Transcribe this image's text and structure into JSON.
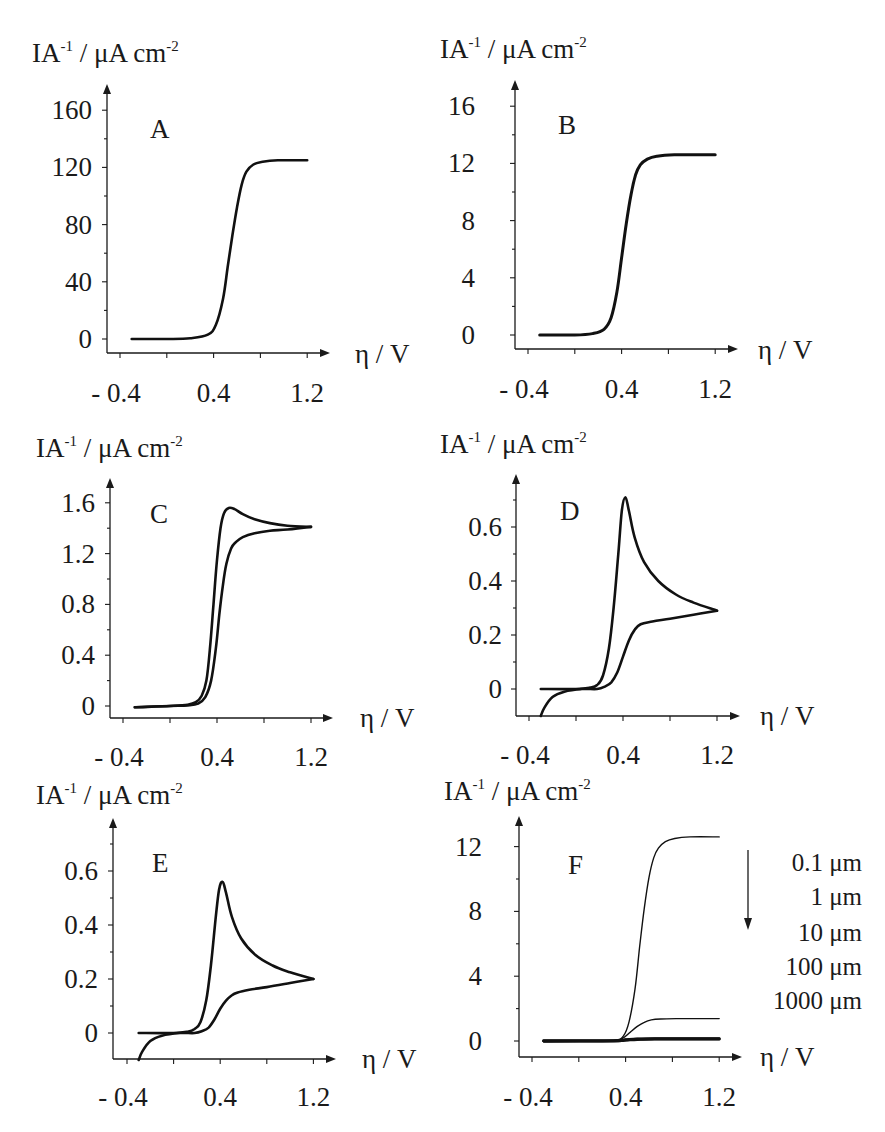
{
  "figure": {
    "ylabel_main": "IA",
    "ylabel_sup1": "-1",
    "ylabel_unit": " / μA cm",
    "ylabel_sup2": "-2",
    "xlabel": "η / V"
  },
  "chart_data": [
    {
      "panel": "A",
      "type": "line",
      "title": "A",
      "xlabel": "η / V",
      "ylabel": "IA-1 / μA cm-2",
      "xticks": [
        -0.4,
        0.0,
        0.4,
        0.8,
        1.2
      ],
      "xtick_labels": [
        "- 0.4",
        "",
        "0.4",
        "",
        "1.2"
      ],
      "yticks": [
        0,
        40,
        80,
        120,
        160
      ],
      "ytick_labels": [
        "0",
        "40",
        "80",
        "120",
        "160"
      ],
      "xlim": [
        -0.5,
        1.5
      ],
      "ylim": [
        -8,
        175
      ],
      "series": [
        {
          "name": "forward/reverse",
          "x": [
            -0.3,
            0.0,
            0.2,
            0.35,
            0.42,
            0.48,
            0.52,
            0.56,
            0.6,
            0.64,
            0.68,
            0.74,
            0.82,
            0.95,
            1.2
          ],
          "y": [
            0,
            0,
            0.5,
            3,
            10,
            28,
            50,
            72,
            92,
            108,
            117,
            122,
            124,
            125,
            125
          ]
        }
      ]
    },
    {
      "panel": "B",
      "type": "line",
      "title": "B",
      "xlabel": "η / V",
      "ylabel": "IA-1 / μA cm-2",
      "xticks": [
        -0.4,
        0.0,
        0.4,
        0.8,
        1.2
      ],
      "xtick_labels": [
        "- 0.4",
        "",
        "0.4",
        "",
        "1.2"
      ],
      "yticks": [
        0,
        4,
        8,
        12,
        16
      ],
      "ytick_labels": [
        "0",
        "4",
        "8",
        "12",
        "16"
      ],
      "xlim": [
        -0.5,
        1.5
      ],
      "ylim": [
        -0.8,
        17.5
      ],
      "series": [
        {
          "name": "forward/reverse",
          "x": [
            -0.3,
            0.0,
            0.15,
            0.25,
            0.31,
            0.36,
            0.4,
            0.44,
            0.48,
            0.52,
            0.56,
            0.62,
            0.7,
            0.85,
            1.2
          ],
          "y": [
            0,
            0,
            0.1,
            0.4,
            1.2,
            3.0,
            5.4,
            7.8,
            9.8,
            11.2,
            11.9,
            12.3,
            12.5,
            12.6,
            12.6
          ]
        }
      ]
    },
    {
      "panel": "C",
      "type": "line",
      "title": "C",
      "xlabel": "η / V",
      "ylabel": "IA-1 / μA cm-2",
      "xticks": [
        -0.4,
        0.0,
        0.4,
        0.8,
        1.2
      ],
      "xtick_labels": [
        "- 0.4",
        "",
        "0.4",
        "",
        "1.2"
      ],
      "yticks": [
        0,
        0.4,
        0.8,
        1.2,
        1.6
      ],
      "ytick_labels": [
        "0",
        "0.4",
        "0.8",
        "1.2",
        "1.6"
      ],
      "xlim": [
        -0.5,
        1.5
      ],
      "ylim": [
        -0.05,
        1.75
      ],
      "series": [
        {
          "name": "forward",
          "x": [
            -0.3,
            0.0,
            0.15,
            0.22,
            0.27,
            0.31,
            0.34,
            0.37,
            0.4,
            0.43,
            0.46,
            0.5,
            0.55,
            0.62,
            0.72,
            0.85,
            1.0,
            1.2
          ],
          "y": [
            -0.01,
            0.0,
            0.01,
            0.03,
            0.08,
            0.2,
            0.45,
            0.8,
            1.15,
            1.4,
            1.52,
            1.56,
            1.55,
            1.51,
            1.47,
            1.44,
            1.42,
            1.41
          ]
        },
        {
          "name": "reverse",
          "x": [
            1.2,
            1.0,
            0.85,
            0.72,
            0.62,
            0.56,
            0.52,
            0.48,
            0.45,
            0.42,
            0.39,
            0.35,
            0.3,
            0.24,
            0.15,
            0.0,
            -0.3
          ],
          "y": [
            1.41,
            1.39,
            1.38,
            1.36,
            1.33,
            1.29,
            1.24,
            1.12,
            0.95,
            0.72,
            0.45,
            0.2,
            0.07,
            0.02,
            0.005,
            0.0,
            -0.01
          ]
        }
      ]
    },
    {
      "panel": "D",
      "type": "line",
      "title": "D",
      "xlabel": "η / V",
      "ylabel": "IA-1 / μA cm-2",
      "xticks": [
        -0.4,
        0.0,
        0.4,
        0.8,
        1.2
      ],
      "xtick_labels": [
        "- 0.4",
        "",
        "0.4",
        "",
        "1.2"
      ],
      "yticks": [
        0,
        0.2,
        0.4,
        0.6
      ],
      "ytick_labels": [
        "0",
        "0.2",
        "0.4",
        "0.6"
      ],
      "xlim": [
        -0.5,
        1.5
      ],
      "ylim": [
        -0.1,
        0.78
      ],
      "series": [
        {
          "name": "forward",
          "x": [
            -0.3,
            0.0,
            0.12,
            0.18,
            0.23,
            0.28,
            0.32,
            0.36,
            0.39,
            0.42,
            0.45,
            0.5,
            0.58,
            0.7,
            0.85,
            1.0,
            1.2
          ],
          "y": [
            0.0,
            0.0,
            0.005,
            0.015,
            0.05,
            0.15,
            0.3,
            0.5,
            0.66,
            0.71,
            0.66,
            0.56,
            0.47,
            0.4,
            0.35,
            0.32,
            0.29
          ]
        },
        {
          "name": "reverse",
          "x": [
            1.2,
            1.0,
            0.8,
            0.65,
            0.55,
            0.5,
            0.45,
            0.4,
            0.35,
            0.3,
            0.25,
            0.18,
            0.05,
            -0.1,
            -0.2,
            -0.27,
            -0.3
          ],
          "y": [
            0.29,
            0.275,
            0.26,
            0.25,
            0.24,
            0.22,
            0.18,
            0.12,
            0.06,
            0.025,
            0.01,
            0.0,
            0.0,
            -0.01,
            -0.03,
            -0.07,
            -0.1
          ]
        }
      ]
    },
    {
      "panel": "E",
      "type": "line",
      "title": "E",
      "xlabel": "η / V",
      "ylabel": "IA-1 / μA cm-2",
      "xticks": [
        -0.4,
        0.0,
        0.4,
        0.8,
        1.2
      ],
      "xtick_labels": [
        "- 0.4",
        "",
        "0.4",
        "",
        "1.2"
      ],
      "yticks": [
        0,
        0.2,
        0.4,
        0.6
      ],
      "ytick_labels": [
        "0",
        "0.2",
        "0.4",
        "0.6"
      ],
      "xlim": [
        -0.5,
        1.5
      ],
      "ylim": [
        -0.1,
        0.78
      ],
      "series": [
        {
          "name": "forward",
          "x": [
            -0.3,
            0.0,
            0.12,
            0.18,
            0.23,
            0.28,
            0.32,
            0.36,
            0.39,
            0.42,
            0.45,
            0.5,
            0.58,
            0.7,
            0.85,
            1.0,
            1.2
          ],
          "y": [
            0.0,
            0.0,
            0.005,
            0.015,
            0.04,
            0.12,
            0.25,
            0.42,
            0.53,
            0.56,
            0.52,
            0.43,
            0.35,
            0.29,
            0.25,
            0.225,
            0.2
          ]
        },
        {
          "name": "reverse",
          "x": [
            1.2,
            1.0,
            0.8,
            0.65,
            0.55,
            0.5,
            0.45,
            0.4,
            0.35,
            0.3,
            0.25,
            0.18,
            0.05,
            -0.1,
            -0.2,
            -0.27,
            -0.3
          ],
          "y": [
            0.2,
            0.185,
            0.17,
            0.16,
            0.15,
            0.14,
            0.12,
            0.09,
            0.05,
            0.02,
            0.008,
            0.0,
            0.0,
            -0.01,
            -0.03,
            -0.07,
            -0.1
          ]
        }
      ]
    },
    {
      "panel": "F",
      "type": "line",
      "title": "F",
      "xlabel": "η / V",
      "ylabel": "IA-1 / μA cm-2",
      "xticks": [
        -0.4,
        0.0,
        0.4,
        0.8,
        1.2
      ],
      "xtick_labels": [
        "- 0.4",
        "",
        "0.4",
        "",
        "1.2"
      ],
      "yticks": [
        0,
        4,
        8,
        12
      ],
      "ytick_labels": [
        "0",
        "4",
        "8",
        "12"
      ],
      "xlim": [
        -0.5,
        1.5
      ],
      "ylim": [
        -1,
        15
      ],
      "legend": {
        "position": "right",
        "arrow": "down",
        "entries": [
          "0.1 μm",
          "1 μm",
          "10 μm",
          "100 μm",
          "1000 μm"
        ]
      },
      "series": [
        {
          "name": "0.1 μm",
          "x": [
            -0.3,
            0.0,
            0.3,
            0.38,
            0.43,
            0.48,
            0.52,
            0.56,
            0.6,
            0.64,
            0.68,
            0.74,
            0.82,
            0.95,
            1.2
          ],
          "y": [
            0,
            0,
            0.05,
            0.3,
            1.2,
            3.2,
            5.8,
            8.2,
            10.1,
            11.3,
            11.9,
            12.3,
            12.5,
            12.6,
            12.6
          ]
        },
        {
          "name": "1 μm",
          "x": [
            -0.3,
            0.0,
            0.3,
            0.38,
            0.44,
            0.5,
            0.56,
            0.62,
            0.7,
            0.85,
            1.2
          ],
          "y": [
            0,
            0,
            0.02,
            0.2,
            0.55,
            0.9,
            1.15,
            1.3,
            1.36,
            1.38,
            1.38
          ]
        },
        {
          "name": "10 μm",
          "x": [
            -0.3,
            0.3,
            0.4,
            0.5,
            0.65,
            1.2
          ],
          "y": [
            0,
            0.01,
            0.08,
            0.13,
            0.15,
            0.15
          ]
        },
        {
          "name": "100 μm",
          "x": [
            -0.3,
            0.3,
            0.4,
            0.5,
            0.65,
            1.2
          ],
          "y": [
            0,
            0.01,
            0.06,
            0.11,
            0.13,
            0.13
          ]
        },
        {
          "name": "1000 μm",
          "x": [
            -0.3,
            0.3,
            0.4,
            0.5,
            0.65,
            1.2
          ],
          "y": [
            0,
            0.01,
            0.05,
            0.09,
            0.11,
            0.11
          ]
        }
      ]
    }
  ]
}
